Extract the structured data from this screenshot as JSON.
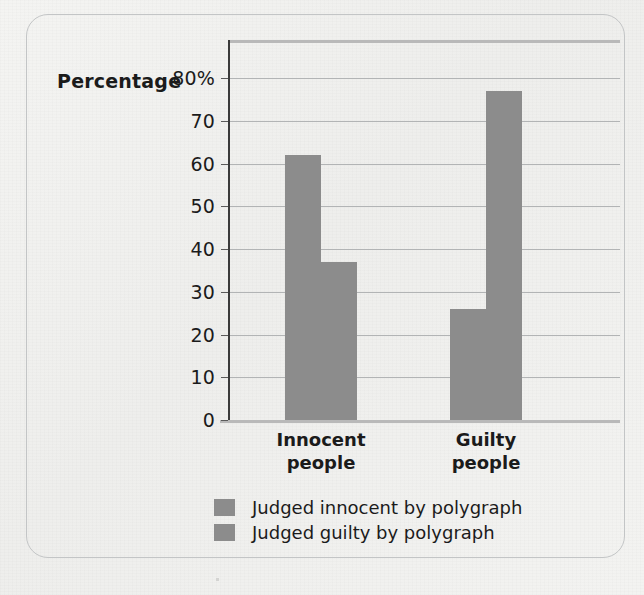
{
  "chart_data": {
    "type": "bar",
    "title": "",
    "xlabel": "",
    "ylabel": "Percentage",
    "categories": [
      "Innocent people",
      "Guilty people"
    ],
    "category_lines": [
      [
        "Innocent",
        "people"
      ],
      [
        "Guilty",
        "people"
      ]
    ],
    "series": [
      {
        "name": "Judged innocent by polygraph",
        "values": [
          62,
          26
        ],
        "color": "#8c8c8c"
      },
      {
        "name": "Judged guilty by polygraph",
        "values": [
          37,
          77
        ],
        "color": "#8c8c8c"
      }
    ],
    "ylim": [
      0,
      80
    ],
    "yticks": [
      0,
      10,
      20,
      30,
      40,
      50,
      60,
      70,
      80
    ],
    "ytick_labels": [
      "0",
      "10",
      "20",
      "30",
      "40",
      "50",
      "60",
      "70",
      "80%"
    ],
    "grid": true,
    "legend_position": "bottom-center"
  },
  "axis": {
    "title": "Percentage",
    "unit_suffix": "%"
  },
  "legend": {
    "items": [
      {
        "label": "Judged innocent by polygraph",
        "color": "#8c8c8c"
      },
      {
        "label": "Judged guilty by polygraph",
        "color": "#8c8c8c"
      }
    ]
  },
  "colors": {
    "bar": "#8c8c8c",
    "grid": "#b2b4b5",
    "axis": "#3a3a3a",
    "frame": "#c3c5c6",
    "background": "#f2f2f0",
    "text": "#1b1b1b"
  }
}
